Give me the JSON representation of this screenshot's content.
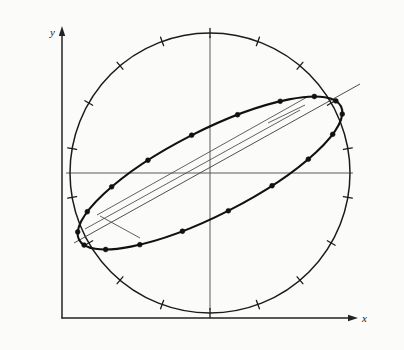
{
  "figure": {
    "background_color": "#fbfbfa",
    "ink_color": "#1b1b1b",
    "thin_color": "#4a4a4a",
    "axes": {
      "x_label": "x",
      "y_label": "y",
      "origin_px": [
        62,
        318
      ],
      "x_axis_end_px": [
        352,
        318
      ],
      "y_axis_top_px": [
        62,
        32
      ],
      "arrowheads": [
        "x-axis-arrow",
        "y-axis-arrow"
      ]
    },
    "plot_axes": {
      "center_px": [
        210,
        173
      ],
      "horizontal_extent_px": [
        66,
        353
      ],
      "vertical_extent_px": [
        36,
        310
      ]
    },
    "circle": {
      "name": "reference-circle",
      "center_px": [
        210,
        173
      ],
      "radius_px": 140,
      "tick_count": 18,
      "tick_spacing_deg": 20,
      "tick_start_deg": 10,
      "tick_length_px": 9
    },
    "ellipse": {
      "name": "inclined-ellipse",
      "center_px": [
        210,
        173
      ],
      "semi_major_px": 147,
      "semi_minor_px": 42,
      "rotation_deg": -27,
      "marker_count": 18,
      "marker_radius_px": 2.4
    },
    "major_axis_line": {
      "name": "major-axis-line",
      "from_px": [
        74,
        243
      ],
      "to_px": [
        360,
        84
      ]
    },
    "chords": [
      {
        "name": "chord-upper",
        "from_px": [
          97,
          215
        ],
        "to_px": [
          309,
          96
        ]
      },
      {
        "name": "chord-lower",
        "from_px": [
          85,
          229
        ],
        "to_px": [
          300,
          110
        ]
      },
      {
        "name": "chord-cross-right",
        "from_px": [
          268,
          123
        ],
        "to_px": [
          305,
          105
        ]
      },
      {
        "name": "chord-cross-left",
        "from_px": [
          100,
          216
        ],
        "to_px": [
          140,
          238
        ]
      }
    ],
    "chart_data": {
      "type": "scatter",
      "title": "Inclined ellipse inscribed in a reference circle",
      "xlabel": "x",
      "ylabel": "y",
      "grid": false,
      "legend": false,
      "xlim": [
        -1.05,
        1.05
      ],
      "ylim": [
        -1.05,
        1.05
      ],
      "series": [
        {
          "name": "reference-circle",
          "kind": "circle",
          "center": [
            0,
            0
          ],
          "radius": 1.0,
          "tick_angles_deg": [
            10,
            30,
            50,
            70,
            90,
            110,
            130,
            150,
            170,
            190,
            210,
            230,
            250,
            270,
            290,
            310,
            330,
            350
          ]
        },
        {
          "name": "inclined-ellipse",
          "kind": "ellipse",
          "center": [
            0,
            0
          ],
          "semi_major": 1.05,
          "semi_minor": 0.3,
          "rotation_deg": 27
        },
        {
          "name": "ellipse-sample-points",
          "kind": "points",
          "x": [
            -0.935,
            -0.805,
            -0.636,
            -0.439,
            -0.225,
            -0.005,
            0.213,
            0.424,
            0.618,
            0.786,
            0.912,
            0.986,
            0.958,
            0.853,
            0.693,
            0.489,
            0.257,
            0.012
          ],
          "y": [
            -0.355,
            -0.45,
            -0.486,
            -0.468,
            -0.405,
            -0.304,
            -0.178,
            -0.035,
            0.116,
            0.261,
            0.388,
            0.49,
            0.434,
            0.344,
            0.23,
            0.1,
            -0.04,
            -0.181
          ]
        },
        {
          "name": "major-axis-line",
          "kind": "line",
          "x": [
            -0.97,
            1.07
          ],
          "y": [
            -0.5,
            0.635
          ]
        }
      ]
    }
  }
}
